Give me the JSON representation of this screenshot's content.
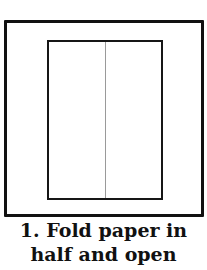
{
  "diagram": {
    "step_caption_line1": "1. Fold paper in",
    "step_caption_line2": "half and open",
    "colors": {
      "frame": "#111111",
      "paper_outline": "#161616",
      "fold_line": "#9a9a9a",
      "background": "#ffffff"
    }
  }
}
